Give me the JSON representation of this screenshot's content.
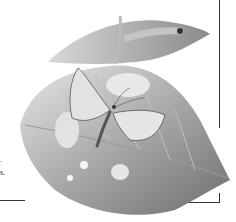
{
  "illustration": {
    "subject": "butterfly on leaf with caterpillar on rolled leaf",
    "edge_text": [
      ".",
      "s."
    ],
    "colors": {
      "ink": "#333333",
      "leaf_dark": "#7a7a7a",
      "leaf_light": "#cfcfcf",
      "paper": "#ffffff"
    }
  }
}
